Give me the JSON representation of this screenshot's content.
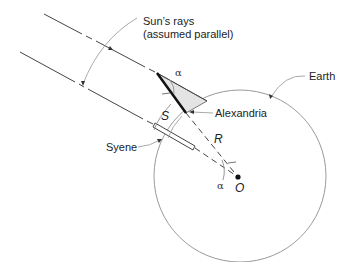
{
  "diagram": {
    "type": "eratosthenes-earth-circumference",
    "labels": {
      "sun_rays_line1": "Sun’s rays",
      "sun_rays_line2": "(assumed parallel)",
      "earth": "Earth",
      "alexandria": "Alexandria",
      "syene": "Syene",
      "arc_length": "S",
      "radius": "R",
      "center": "O",
      "angle_top": "α",
      "angle_center": "α"
    },
    "colors": {
      "line": "#444444",
      "circle": "#999999",
      "leader": "#aaaaaa",
      "shadow_fill": "#e4e4e4",
      "gnomon": "#111111"
    }
  }
}
